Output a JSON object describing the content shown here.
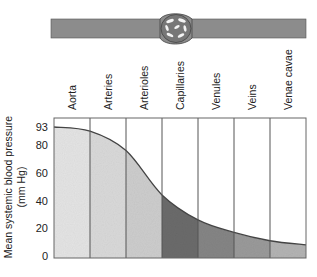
{
  "vessel_diagram": {
    "label": "blood vessel with capillary bed"
  },
  "chart_data": {
    "type": "area",
    "title": "",
    "xlabel": "",
    "ylabel": "Mean systemic blood pressure (mm Hg)",
    "ylabel_line1": "Mean systemic blood pressure",
    "ylabel_line2": "(mm Hg)",
    "categories": [
      "Aorta",
      "Arteries",
      "Arterioles",
      "Capillaries",
      "Venules",
      "Veins",
      "Venae cavae"
    ],
    "yticks": [
      "0",
      "20",
      "40",
      "60",
      "80",
      "93"
    ],
    "ytick_values": [
      0,
      20,
      40,
      60,
      80,
      93
    ],
    "ylim": [
      0,
      100
    ],
    "boundary_pressures": [
      93,
      90,
      76,
      44,
      26,
      17,
      11,
      8
    ],
    "segment_fills": [
      "#e4e4e4",
      "#d9d9d9",
      "#cdcdcd",
      "#6b6b6b",
      "#858585",
      "#9a9a9a",
      "#b3b3b3"
    ],
    "grid": false,
    "legend": "none"
  }
}
